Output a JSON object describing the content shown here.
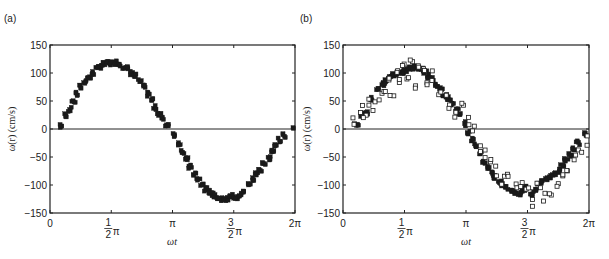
{
  "chart_data": [
    {
      "type": "scatter",
      "panel_label": "(a)",
      "title": "",
      "xlabel": "ωt",
      "ylabel": "ω(r) (cm/s)",
      "xlim": [
        0,
        6.2832
      ],
      "ylim": [
        -150,
        150
      ],
      "x_ticks": [
        {
          "value": 0,
          "label": "0"
        },
        {
          "value": 1.5708,
          "label": "½π"
        },
        {
          "value": 3.1416,
          "label": "π"
        },
        {
          "value": 4.7124,
          "label": "3⁄2π"
        },
        {
          "value": 6.2832,
          "label": "2π"
        }
      ],
      "y_ticks": [
        150,
        100,
        50,
        0,
        -50,
        -100,
        -150
      ],
      "zero_line": true,
      "grid": false,
      "series": [
        {
          "name": "measured",
          "marker": "filled-square",
          "amplitude_approx": 120,
          "x": [
            0.3,
            0.4,
            0.5,
            0.6,
            0.7,
            0.8,
            0.9,
            1.0,
            1.1,
            1.2,
            1.3,
            1.4,
            1.5,
            1.6,
            1.7,
            1.8,
            1.9,
            2.0,
            2.1,
            2.2,
            2.3,
            2.4,
            2.5,
            2.6,
            2.7,
            2.8,
            2.9,
            3.0,
            3.2,
            3.3,
            3.4,
            3.5,
            3.6,
            3.7,
            3.8,
            3.9,
            4.0,
            4.1,
            4.2,
            4.3,
            4.4,
            4.5,
            4.6,
            4.7,
            4.8,
            4.9,
            5.0,
            5.1,
            5.2,
            5.3,
            5.4,
            5.5,
            5.6,
            5.7,
            5.8,
            5.9,
            6.0,
            6.28
          ],
          "y": [
            5,
            25,
            35,
            50,
            62,
            75,
            85,
            92,
            100,
            108,
            112,
            115,
            118,
            117,
            119,
            116,
            112,
            108,
            100,
            95,
            85,
            75,
            62,
            52,
            38,
            28,
            18,
            8,
            -10,
            -25,
            -40,
            -55,
            -68,
            -80,
            -90,
            -100,
            -108,
            -112,
            -118,
            -122,
            -124,
            -125,
            -123,
            -120,
            -122,
            -118,
            -110,
            -100,
            -90,
            -80,
            -72,
            -62,
            -52,
            -40,
            -30,
            -20,
            -12,
            5
          ]
        }
      ]
    },
    {
      "type": "scatter",
      "panel_label": "(b)",
      "title": "",
      "xlabel": "ωt",
      "ylabel": "ω(r) (cm/s)",
      "xlim": [
        0,
        6.2832
      ],
      "ylim": [
        -150,
        150
      ],
      "x_ticks": [
        {
          "value": 0,
          "label": "0"
        },
        {
          "value": 1.5708,
          "label": "½π"
        },
        {
          "value": 3.1416,
          "label": "π"
        },
        {
          "value": 4.7124,
          "label": "3⁄2π"
        },
        {
          "value": 6.2832,
          "label": "2π"
        }
      ],
      "y_ticks": [
        150,
        100,
        50,
        0,
        -50,
        -100,
        -150
      ],
      "zero_line": true,
      "grid": false,
      "series": [
        {
          "name": "measured (filled)",
          "marker": "filled-square",
          "x": [
            0.35,
            0.5,
            0.6,
            0.75,
            0.9,
            1.0,
            1.1,
            1.2,
            1.3,
            1.4,
            1.5,
            1.6,
            1.7,
            1.8,
            1.9,
            2.0,
            2.1,
            2.2,
            2.3,
            2.4,
            2.5,
            2.6,
            2.7,
            2.8,
            2.9,
            3.0,
            3.1,
            3.2,
            3.3,
            3.4,
            3.5,
            3.6,
            3.7,
            3.8,
            3.9,
            4.0,
            4.1,
            4.2,
            4.3,
            4.4,
            4.5,
            4.6,
            4.7,
            4.8,
            4.9,
            5.0,
            5.1,
            5.2,
            5.3,
            5.4,
            5.5,
            5.6,
            5.7,
            5.8,
            5.9,
            6.0,
            6.2
          ],
          "y": [
            10,
            25,
            30,
            55,
            70,
            80,
            85,
            90,
            95,
            100,
            100,
            105,
            108,
            110,
            110,
            105,
            100,
            95,
            90,
            80,
            70,
            60,
            55,
            45,
            35,
            25,
            10,
            -5,
            -20,
            -30,
            -45,
            -60,
            -70,
            -80,
            -85,
            -95,
            -100,
            -105,
            -110,
            -112,
            -115,
            -110,
            -105,
            -115,
            -108,
            -100,
            -95,
            -90,
            -85,
            -80,
            -75,
            -65,
            -55,
            -45,
            -35,
            -25,
            -10
          ]
        },
        {
          "name": "model (open)",
          "marker": "open-square",
          "x": [
            0.3,
            0.45,
            0.55,
            0.7,
            0.8,
            0.95,
            1.05,
            1.15,
            1.25,
            1.35,
            1.45,
            1.55,
            1.65,
            1.75,
            1.85,
            1.95,
            2.05,
            2.15,
            2.3,
            2.45,
            2.6,
            2.75,
            2.9,
            3.05,
            3.2,
            3.35,
            3.5,
            3.65,
            3.8,
            3.95,
            4.1,
            4.25,
            4.4,
            4.55,
            4.7,
            4.85,
            5.0,
            5.15,
            5.3,
            5.45,
            5.6,
            5.75,
            5.9,
            6.05,
            6.2
          ],
          "y": [
            15,
            35,
            20,
            45,
            40,
            60,
            70,
            85,
            65,
            100,
            90,
            110,
            95,
            125,
            80,
            115,
            105,
            85,
            95,
            70,
            60,
            40,
            30,
            40,
            15,
            0,
            -35,
            -45,
            -60,
            -75,
            -90,
            -80,
            -100,
            -95,
            -110,
            -130,
            -105,
            -120,
            -110,
            -100,
            -85,
            -70,
            -55,
            -40,
            -20
          ]
        }
      ]
    }
  ],
  "panels": [
    {
      "label": "(a)",
      "xlabel": "ωt",
      "ylabel": "ω(r) (cm/s)"
    },
    {
      "label": "(b)",
      "xlabel": "ωt",
      "ylabel": "ω(r) (cm/s)"
    }
  ]
}
